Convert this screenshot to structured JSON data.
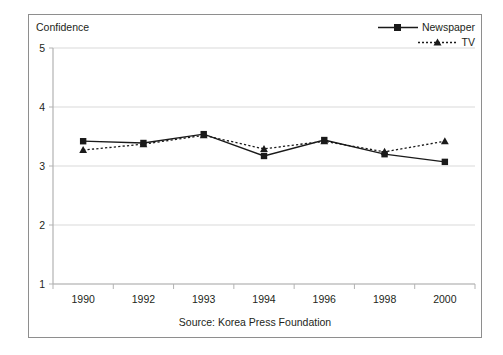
{
  "chart_data": {
    "type": "line",
    "title": "",
    "ylabel": "Confidence",
    "xlabel": "",
    "categories": [
      "1990",
      "1992",
      "1993",
      "1994",
      "1996",
      "1998",
      "2000"
    ],
    "ylim": [
      1,
      5
    ],
    "yticks": [
      1,
      2,
      3,
      4,
      5
    ],
    "grid": true,
    "legend_position": "top-right",
    "source": "Source: Korea Press Foundation",
    "series": [
      {
        "name": "Newspaper",
        "marker": "square",
        "line_style": "solid",
        "color": "#1a1a1a",
        "values": [
          3.42,
          3.39,
          3.54,
          3.17,
          3.44,
          3.2,
          3.07
        ]
      },
      {
        "name": "TV",
        "marker": "triangle",
        "line_style": "dotted",
        "color": "#1a1a1a",
        "values": [
          3.27,
          3.37,
          3.52,
          3.29,
          3.42,
          3.24,
          3.42
        ]
      }
    ]
  },
  "frame": {
    "border_color": "#8e8e8e",
    "grid_color": "#d9d9d9",
    "axis_color": "#b3b3b3"
  },
  "legend": {
    "items": [
      {
        "label": "Newspaper"
      },
      {
        "label": "TV"
      }
    ]
  }
}
